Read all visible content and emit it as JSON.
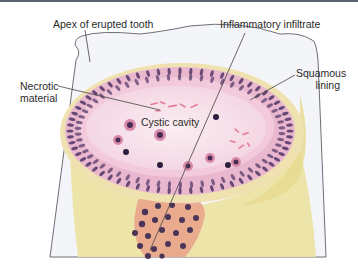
{
  "diagram": {
    "labels": {
      "apex": "Apex of erupted tooth",
      "inflammatory": "Inflammatory infiltrate",
      "necrotic_line1": "Necrotic",
      "necrotic_line2": "material",
      "squamous_line1": "Squamous",
      "squamous_line2": "lining",
      "cavity": "Cystic cavity"
    },
    "colors": {
      "tooth_outline": "#6e6e78",
      "tooth_fill": "#f4f5f8",
      "connective_tissue": "#ece3a4",
      "cyst_wall": "#e9b8cf",
      "cavity": "#f7e3ec",
      "nuclei": "#5a3c6a",
      "infiltrate": "#e9a08a",
      "leader_line": "#444444"
    }
  }
}
